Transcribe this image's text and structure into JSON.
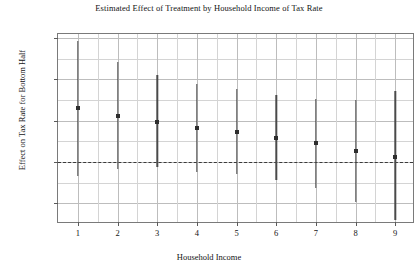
{
  "chart_data": {
    "type": "scatter",
    "title": "Estimated Effect of Treatment by Household Income of Tax Rate",
    "xlabel": "Household Income",
    "ylabel": "Effect on Tax Rate for Bottom Half",
    "xlim": [
      0.5,
      9.5
    ],
    "ylim": [
      -0.3,
      0.62
    ],
    "grid": true,
    "legend": null,
    "reference_line": {
      "y": 0.0,
      "style": "dashed"
    },
    "x_ticks": [
      "1",
      "2",
      "3",
      "4",
      "5",
      "6",
      "7",
      "8",
      "9"
    ],
    "y_ticks": [
      "0.6",
      "0.4",
      "0.2",
      "0.0",
      "-0.2"
    ],
    "y_tick_values": [
      0.6,
      0.4,
      0.2,
      0.0,
      -0.2
    ],
    "x": [
      1,
      2,
      3,
      4,
      5,
      6,
      7,
      8,
      9
    ],
    "values": [
      0.26,
      0.225,
      0.195,
      0.165,
      0.145,
      0.115,
      0.09,
      0.055,
      0.025
    ],
    "ci_low": [
      -0.07,
      -0.035,
      -0.025,
      -0.05,
      -0.06,
      -0.085,
      -0.125,
      -0.195,
      -0.28
    ],
    "ci_high": [
      0.585,
      0.485,
      0.42,
      0.38,
      0.355,
      0.325,
      0.305,
      0.3,
      0.345
    ],
    "series": [
      {
        "name": "Estimated effect",
        "points": [
          {
            "x": 1,
            "y": 0.26,
            "ci_low": -0.07,
            "ci_high": 0.585
          },
          {
            "x": 2,
            "y": 0.225,
            "ci_low": -0.035,
            "ci_high": 0.485
          },
          {
            "x": 3,
            "y": 0.195,
            "ci_low": -0.025,
            "ci_high": 0.42
          },
          {
            "x": 4,
            "y": 0.165,
            "ci_low": -0.05,
            "ci_high": 0.38
          },
          {
            "x": 5,
            "y": 0.145,
            "ci_low": -0.06,
            "ci_high": 0.355
          },
          {
            "x": 6,
            "y": 0.115,
            "ci_low": -0.085,
            "ci_high": 0.325
          },
          {
            "x": 7,
            "y": 0.09,
            "ci_low": -0.125,
            "ci_high": 0.305
          },
          {
            "x": 8,
            "y": 0.055,
            "ci_low": -0.195,
            "ci_high": 0.3
          },
          {
            "x": 9,
            "y": 0.025,
            "ci_low": -0.28,
            "ci_high": 0.345
          }
        ]
      }
    ],
    "colors": {
      "marker": "#2e2e2e",
      "errorbar": "#4a4a4a",
      "grid": "#d4d4d4",
      "axis": "#7a7a7a",
      "zero_line": "#3a3a3a"
    }
  }
}
